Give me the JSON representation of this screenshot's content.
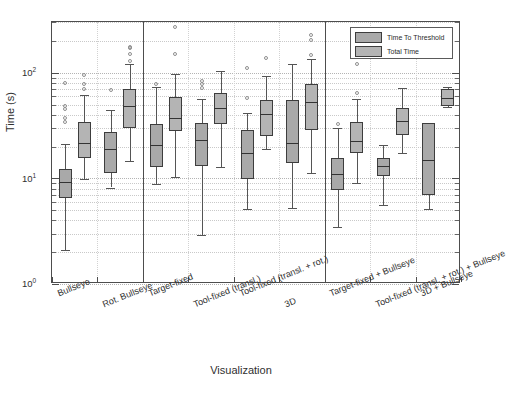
{
  "chart_data": {
    "type": "box",
    "title": "",
    "xlabel": "Visualization",
    "ylabel": "Time (s)",
    "yscale": "log",
    "ylim": [
      1,
      400
    ],
    "ytick_labels": [
      "10^0",
      "10^1",
      "10^2"
    ],
    "ytick_values": [
      1,
      10,
      100
    ],
    "grid": true,
    "legend_position": "top-right",
    "legend": [
      "Time To Threshold",
      "Total Time"
    ],
    "categories": [
      "Bullseye",
      "Rot. Bullseye",
      "Target-fixed",
      "Tool-fixed (transl.)",
      "Tool-fixed (transl. + rot.)",
      "3D",
      "Target-fixed + Bullseye",
      "Tool-fixed (transl. + rot.) + Bullseye",
      "3D + Bullseye"
    ],
    "group_separators_after": [
      2,
      6
    ],
    "series": [
      {
        "name": "Time To Threshold",
        "color": "#a9a9a9",
        "boxes": [
          {
            "category": "Bullseye",
            "whislo": 2.1,
            "q1": 6.5,
            "med": 9.2,
            "q3": 12.3,
            "whishi": 21.0,
            "outliers": [
              34.0,
              37.5,
              45.0,
              48.0,
              80.0
            ]
          },
          {
            "category": "Rot. Bullseye",
            "whislo": 8.2,
            "q1": 11.3,
            "med": 18.8,
            "q3": 27.5,
            "whishi": 44.0,
            "outliers": [
              68.0
            ]
          },
          {
            "category": "Target-fixed",
            "whislo": 8.9,
            "q1": 12.8,
            "med": 20.5,
            "q3": 33.0,
            "whishi": 73.0,
            "outliers": [
              78.0
            ]
          },
          {
            "category": "Tool-fixed (transl.)",
            "whislo": 2.9,
            "q1": 13.2,
            "med": 23.0,
            "q3": 33.5,
            "whishi": 57.0,
            "outliers": [
              72.0,
              78.0,
              84.0
            ]
          },
          {
            "category": "Tool-fixed (transl. + rot.)",
            "whislo": 5.1,
            "q1": 9.8,
            "med": 17.5,
            "q3": 28.5,
            "whishi": 42.0,
            "outliers": [
              58.0,
              110.0
            ]
          },
          {
            "category": "3D",
            "whislo": 5.2,
            "q1": 14.0,
            "med": 21.5,
            "q3": 55.0,
            "whishi": 122.0,
            "outliers": []
          },
          {
            "category": "Target-fixed + Bullseye",
            "whislo": 3.5,
            "q1": 7.8,
            "med": 11.0,
            "q3": 15.5,
            "whishi": 30.0,
            "outliers": [
              33.0
            ]
          },
          {
            "category": "Tool-fixed (transl. + rot.) + Bullseye",
            "whislo": 5.6,
            "q1": 10.5,
            "med": 13.0,
            "q3": 15.5,
            "whishi": 20.5,
            "outliers": []
          },
          {
            "category": "3D + Bullseye",
            "whislo": 5.1,
            "q1": 6.9,
            "med": 15.0,
            "q3": 33.5,
            "whishi": 33.5,
            "outliers": []
          }
        ]
      },
      {
        "name": "Total Time",
        "color": "#b4b4b4",
        "boxes": [
          {
            "category": "Bullseye",
            "whislo": 9.9,
            "q1": 15.5,
            "med": 21.5,
            "q3": 34.5,
            "whishi": 61.0,
            "outliers": [
              70.0,
              78.0,
              96.0
            ]
          },
          {
            "category": "Rot. Bullseye",
            "whislo": 14.5,
            "q1": 30.0,
            "med": 48.0,
            "q3": 70.0,
            "whishi": 120.0,
            "outliers": [
              128.0,
              150.0,
              170.0,
              175.0
            ]
          },
          {
            "category": "Target-fixed",
            "whislo": 10.3,
            "q1": 28.0,
            "med": 37.0,
            "q3": 59.0,
            "whishi": 98.0,
            "outliers": [
              150.0,
              270.0
            ]
          },
          {
            "category": "Tool-fixed (transl.)",
            "whislo": 12.8,
            "q1": 32.5,
            "med": 46.0,
            "q3": 64.0,
            "whishi": 103.0,
            "outliers": []
          },
          {
            "category": "Tool-fixed (transl. + rot.)",
            "whislo": 19.0,
            "q1": 25.0,
            "med": 41.0,
            "q3": 55.0,
            "whishi": 93.0,
            "outliers": [
              137.0
            ]
          },
          {
            "category": "3D",
            "whislo": 11.3,
            "q1": 29.0,
            "med": 53.0,
            "q3": 78.0,
            "whishi": 135.0,
            "outliers": [
              148.0,
              205.0,
              228.0,
              330.0
            ]
          },
          {
            "category": "Target-fixed + Bullseye",
            "whislo": 9.1,
            "q1": 17.5,
            "med": 22.5,
            "q3": 34.5,
            "whishi": 57.0,
            "outliers": [
              64.0,
              122.0
            ]
          },
          {
            "category": "Tool-fixed (transl. + rot.) + Bullseye",
            "whislo": 17.5,
            "q1": 26.0,
            "med": 35.0,
            "q3": 46.5,
            "whishi": 72.0,
            "outliers": []
          },
          {
            "category": "3D + Bullseye",
            "whislo": 47.0,
            "q1": 49.0,
            "med": 58.0,
            "q3": 70.0,
            "whishi": 73.0,
            "outliers": []
          }
        ]
      }
    ]
  }
}
